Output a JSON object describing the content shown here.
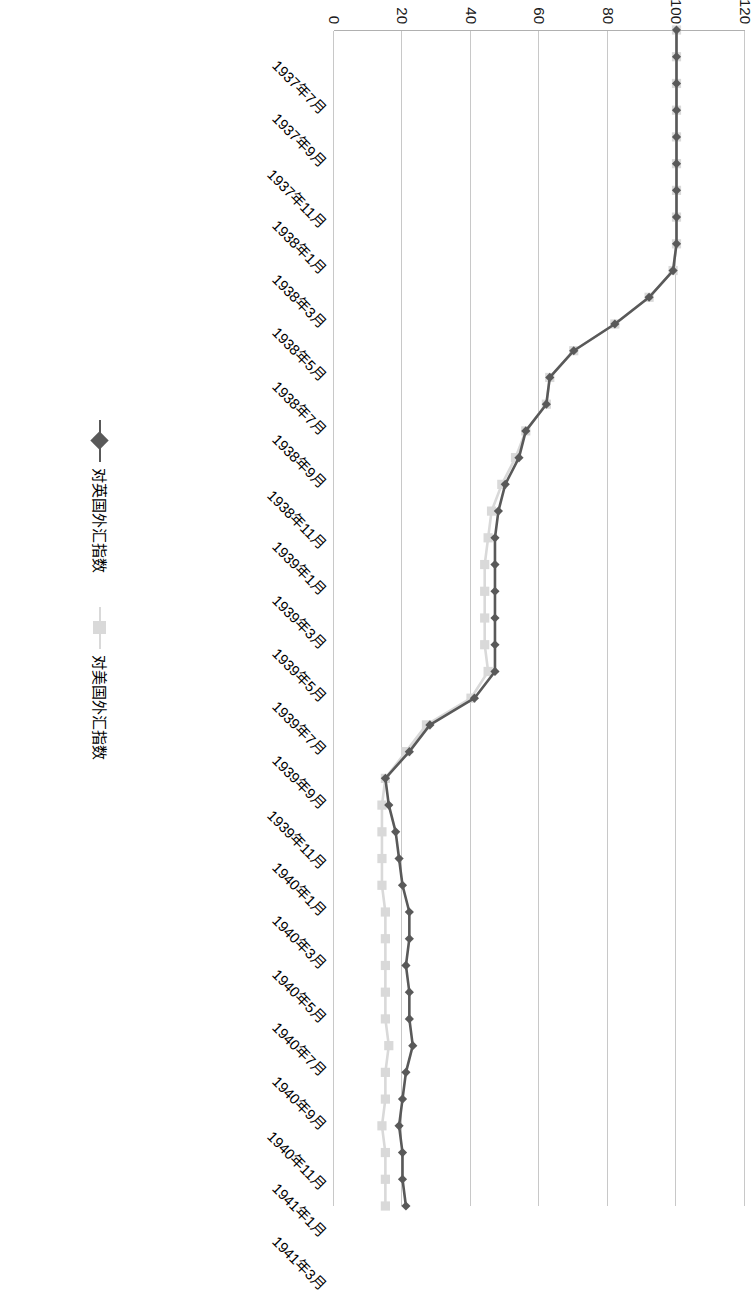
{
  "chart_data": {
    "type": "line",
    "title": "",
    "xlabel": "",
    "ylabel": "",
    "ylim": [
      0,
      120
    ],
    "yticks": [
      0,
      20,
      40,
      60,
      80,
      100,
      120
    ],
    "grid": true,
    "legend_position": "bottom",
    "x_tick_labels": [
      "1937年7月",
      "1937年9月",
      "1937年11月",
      "1938年1月",
      "1938年3月",
      "1938年5月",
      "1938年7月",
      "1938年9月",
      "1938年11月",
      "1939年1月",
      "1939年3月",
      "1939年5月",
      "1939年7月",
      "1939年9月",
      "1939年11月",
      "1940年1月",
      "1940年3月",
      "1940年5月",
      "1940年7月",
      "1940年9月",
      "1940年11月",
      "1941年1月",
      "1941年3月"
    ],
    "x": [
      "1937年7月",
      "1937年8月",
      "1937年9月",
      "1937年10月",
      "1937年11月",
      "1937年12月",
      "1938年1月",
      "1938年2月",
      "1938年3月",
      "1938年4月",
      "1938年5月",
      "1938年6月",
      "1938年7月",
      "1938年8月",
      "1938年9月",
      "1938年10月",
      "1938年11月",
      "1938年12月",
      "1939年1月",
      "1939年2月",
      "1939年3月",
      "1939年4月",
      "1939年5月",
      "1939年6月",
      "1939年7月",
      "1939年8月",
      "1939年9月",
      "1939年10月",
      "1939年11月",
      "1939年12月",
      "1940年1月",
      "1940年2月",
      "1940年3月",
      "1940年4月",
      "1940年5月",
      "1940年6月",
      "1940年7月",
      "1940年8月",
      "1940年9月",
      "1940年10月",
      "1940年11月",
      "1940年12月",
      "1941年1月",
      "1941年2月",
      "1941年3月"
    ],
    "series": [
      {
        "name": "对英国外汇指数",
        "color": "#595959",
        "marker": "diamond",
        "values": [
          100,
          100,
          100,
          100,
          100,
          100,
          100,
          100,
          100,
          99,
          92,
          82,
          70,
          63,
          62,
          56,
          54,
          50,
          48,
          47,
          47,
          47,
          47,
          47,
          47,
          41,
          28,
          22,
          15,
          16,
          18,
          19,
          20,
          22,
          22,
          21,
          22,
          22,
          23,
          21,
          20,
          19,
          20,
          20,
          21
        ]
      },
      {
        "name": "对美国外汇指数",
        "color": "#d9d9d9",
        "marker": "square",
        "values": [
          100,
          100,
          100,
          100,
          100,
          100,
          100,
          100,
          100,
          99,
          92,
          82,
          70,
          63,
          62,
          56,
          53,
          49,
          46,
          45,
          44,
          44,
          44,
          44,
          45,
          40,
          27,
          21,
          15,
          14,
          14,
          14,
          14,
          15,
          15,
          15,
          15,
          15,
          16,
          15,
          15,
          14,
          15,
          15,
          15
        ]
      }
    ]
  },
  "legend": {
    "items": [
      {
        "label": "对英国外汇指数",
        "color": "#595959",
        "marker": "diamond"
      },
      {
        "label": "对美国外汇指数",
        "color": "#d9d9d9",
        "marker": "square"
      }
    ]
  }
}
